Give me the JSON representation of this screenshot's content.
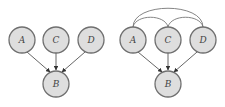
{
  "diagrams": [
    {
      "name": "left-graph",
      "nodes": [
        {
          "id": "A",
          "label": "A",
          "x": 22,
          "y": 40
        },
        {
          "id": "C",
          "label": "C",
          "x": 56,
          "y": 40
        },
        {
          "id": "D",
          "label": "D",
          "x": 91,
          "y": 40
        },
        {
          "id": "B",
          "label": "B",
          "x": 56,
          "y": 84
        }
      ],
      "directed_edges": [
        [
          "A",
          "B"
        ],
        [
          "C",
          "B"
        ],
        [
          "D",
          "B"
        ]
      ],
      "undirected_arcs": []
    },
    {
      "name": "right-graph",
      "nodes": [
        {
          "id": "A",
          "label": "A",
          "x": 133,
          "y": 40
        },
        {
          "id": "C",
          "label": "C",
          "x": 168,
          "y": 40
        },
        {
          "id": "D",
          "label": "D",
          "x": 203,
          "y": 40
        },
        {
          "id": "B",
          "label": "B",
          "x": 168,
          "y": 84
        }
      ],
      "directed_edges": [
        [
          "A",
          "B"
        ],
        [
          "C",
          "B"
        ],
        [
          "D",
          "B"
        ]
      ],
      "undirected_arcs": [
        [
          "A",
          "C"
        ],
        [
          "C",
          "D"
        ],
        [
          "A",
          "D"
        ]
      ]
    }
  ],
  "style": {
    "node_fill": "#dedede",
    "node_stroke": "#6f6f6f",
    "node_radius": 13
  }
}
